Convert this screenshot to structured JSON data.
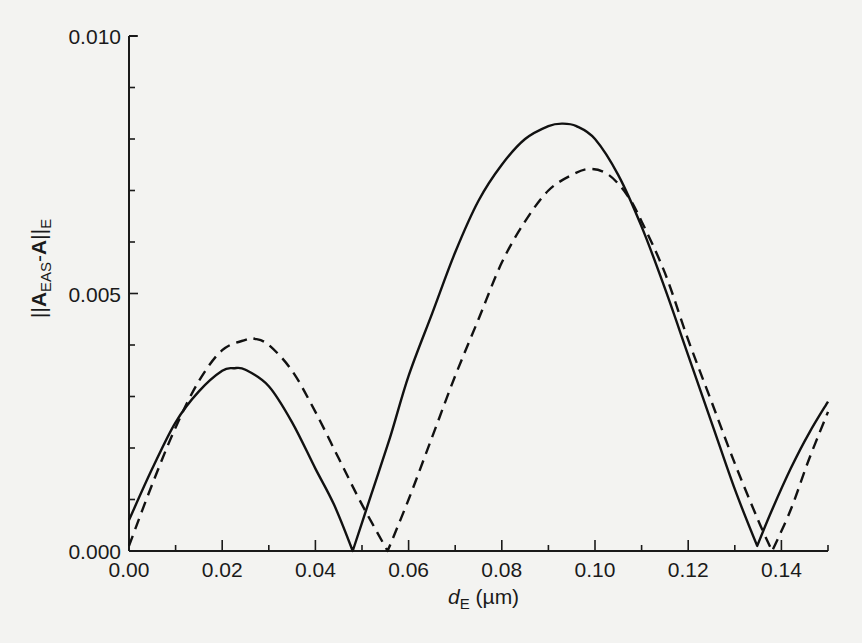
{
  "chart_data": {
    "type": "line",
    "title": "",
    "xlabel": "d_E (µm)",
    "xlabel_main": "d",
    "xlabel_sub": "E",
    "xlabel_unit": " (µm)",
    "ylabel": "||A_EAS-A||_E",
    "ylabel_parts": {
      "bars_left": "||",
      "A1": "A",
      "sub1": "EAS",
      "dash": "-",
      "A2": "A",
      "bars_right": "||",
      "sub2": "E"
    },
    "xlim": [
      0.0,
      0.15
    ],
    "ylim": [
      0.0,
      0.01
    ],
    "xticks": [
      0.0,
      0.02,
      0.04,
      0.06,
      0.08,
      0.1,
      0.12,
      0.14
    ],
    "xtick_labels": [
      "0.00",
      "0.02",
      "0.04",
      "0.06",
      "0.08",
      "0.10",
      "0.12",
      "0.14"
    ],
    "xminor_ticks": [
      0.01,
      0.03,
      0.05,
      0.07,
      0.09,
      0.11,
      0.13,
      0.15
    ],
    "yticks": [
      0.0,
      0.005,
      0.01
    ],
    "ytick_labels": [
      "0.000",
      "0.005",
      "0.010"
    ],
    "yminor_ticks": [
      0.001,
      0.002,
      0.003,
      0.004,
      0.006,
      0.007,
      0.008,
      0.009
    ],
    "grid": false,
    "legend": null,
    "series": [
      {
        "name": "solid",
        "style": "solid",
        "color": "#111111",
        "x": [
          0.0,
          0.005,
          0.01,
          0.015,
          0.02,
          0.0225,
          0.025,
          0.03,
          0.035,
          0.04,
          0.044,
          0.048,
          0.052,
          0.056,
          0.06,
          0.065,
          0.07,
          0.075,
          0.08,
          0.085,
          0.09,
          0.093,
          0.096,
          0.1,
          0.105,
          0.11,
          0.115,
          0.12,
          0.125,
          0.13,
          0.1348,
          0.138,
          0.142,
          0.146,
          0.15
        ],
        "y": [
          0.0006,
          0.0016,
          0.0025,
          0.0031,
          0.0035,
          0.00355,
          0.00352,
          0.0032,
          0.0025,
          0.0016,
          0.0009,
          0.0,
          0.0011,
          0.0022,
          0.0034,
          0.0046,
          0.0058,
          0.0068,
          0.0075,
          0.008,
          0.00825,
          0.0083,
          0.00825,
          0.008,
          0.0073,
          0.0063,
          0.0051,
          0.0038,
          0.0025,
          0.0012,
          0.0001,
          0.0008,
          0.0016,
          0.0023,
          0.0029
        ]
      },
      {
        "name": "dashed",
        "style": "dashed",
        "color": "#111111",
        "x": [
          0.0,
          0.005,
          0.01,
          0.015,
          0.02,
          0.025,
          0.027,
          0.03,
          0.035,
          0.04,
          0.045,
          0.05,
          0.0555,
          0.06,
          0.065,
          0.07,
          0.075,
          0.08,
          0.085,
          0.09,
          0.095,
          0.099,
          0.103,
          0.107,
          0.11,
          0.115,
          0.12,
          0.125,
          0.13,
          0.135,
          0.138,
          0.142,
          0.146,
          0.15
        ],
        "y": [
          0.0001,
          0.0013,
          0.0024,
          0.0033,
          0.0039,
          0.0041,
          0.00412,
          0.004,
          0.0035,
          0.0027,
          0.0018,
          0.0009,
          0.0,
          0.001,
          0.0022,
          0.0034,
          0.0045,
          0.0056,
          0.0064,
          0.007,
          0.0073,
          0.00742,
          0.0073,
          0.0069,
          0.0064,
          0.0054,
          0.0041,
          0.0029,
          0.0017,
          0.0006,
          0.0,
          0.0008,
          0.0018,
          0.0027
        ]
      }
    ]
  },
  "plot_area": {
    "x0_px": 129,
    "x1_px": 828,
    "y0_px": 551,
    "y1_px": 36
  }
}
